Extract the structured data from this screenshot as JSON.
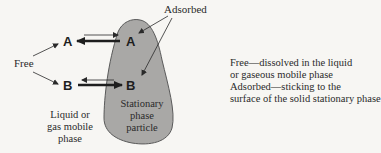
{
  "diagram": {
    "labels": {
      "adsorbed": "Adsorbed",
      "free": "Free",
      "mobile_phase": [
        "Liquid or",
        "gas mobile",
        "phase"
      ],
      "stationary_phase": [
        "Stationary",
        "phase",
        "particle"
      ]
    },
    "species": {
      "a_free": "A",
      "a_adsorbed": "A",
      "b_free": "B",
      "b_adsorbed": "B"
    },
    "legend": {
      "line1": "Free—dissolved in the liquid",
      "line2": "or gaseous mobile phase",
      "line3": "Adsorbed—sticking to the",
      "line4": "surface of the solid stationary phase"
    },
    "colors": {
      "particle_fill": "#a9a8a6",
      "particle_stroke": "#5a5a5a",
      "ink": "#2a2a2a",
      "background": "#f7f6f3"
    }
  }
}
